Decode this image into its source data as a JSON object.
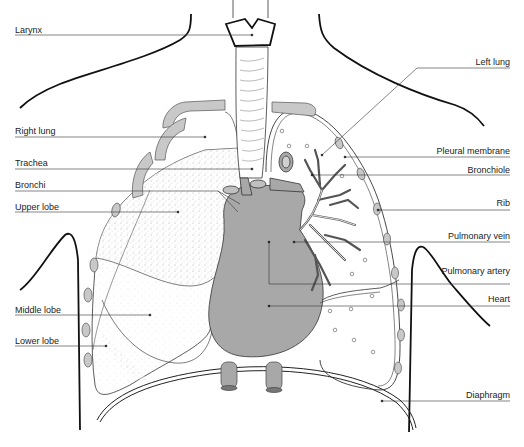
{
  "diagram": {
    "title": "",
    "colors": {
      "line": "#222222",
      "organ_fill": "#a8a8a8",
      "rib_fill": "#c8c8c8",
      "background": "#ffffff"
    },
    "labels_left": [
      {
        "id": "larynx",
        "text": "Larynx",
        "x": 15,
        "y": 25
      },
      {
        "id": "right-lung",
        "text": "Right lung",
        "x": 15,
        "y": 126
      },
      {
        "id": "trachea",
        "text": "Trachea",
        "x": 15,
        "y": 158
      },
      {
        "id": "bronchi",
        "text": "Bronchi",
        "x": 15,
        "y": 180
      },
      {
        "id": "upper-lobe",
        "text": "Upper lobe",
        "x": 15,
        "y": 202
      },
      {
        "id": "middle-lobe",
        "text": "Middle lobe",
        "x": 15,
        "y": 305
      },
      {
        "id": "lower-lobe",
        "text": "Lower lobe",
        "x": 15,
        "y": 336
      }
    ],
    "labels_right": [
      {
        "id": "left-lung",
        "text": "Left lung",
        "right": 14,
        "y": 57
      },
      {
        "id": "pleural-membrane",
        "text": "Pleural membrane",
        "right": 14,
        "y": 146
      },
      {
        "id": "bronchiole",
        "text": "Bronchiole",
        "right": 14,
        "y": 165
      },
      {
        "id": "rib",
        "text": "Rib",
        "right": 14,
        "y": 198
      },
      {
        "id": "pulmonary-vein",
        "text": "Pulmonary vein",
        "right": 14,
        "y": 231
      },
      {
        "id": "pulmonary-artery",
        "text": "Pulmonary artery",
        "right": 14,
        "y": 266
      },
      {
        "id": "heart",
        "text": "Heart",
        "right": 14,
        "y": 294
      },
      {
        "id": "diaphragm",
        "text": "Diaphragm",
        "right": 14,
        "y": 390
      }
    ]
  }
}
